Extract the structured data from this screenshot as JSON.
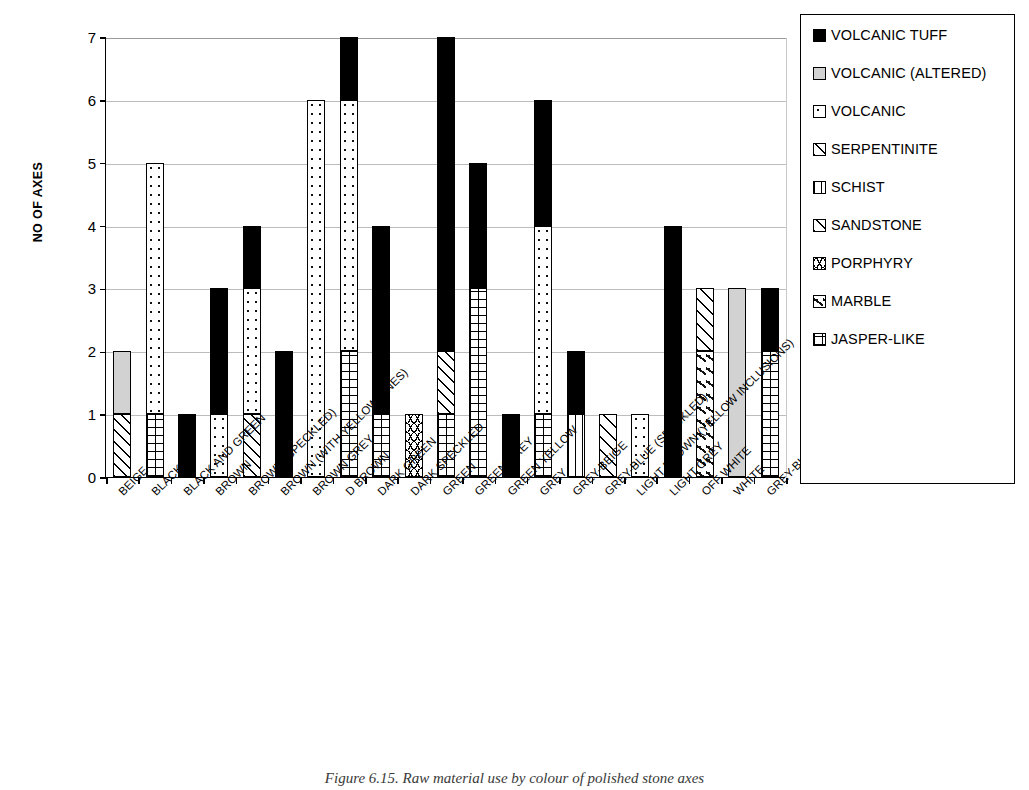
{
  "chart_data": {
    "type": "bar",
    "stacked": true,
    "title": "",
    "xlabel": "",
    "ylabel": "NO OF AXES",
    "ylim": [
      0,
      7
    ],
    "ytick_labels": [
      "0",
      "1",
      "2",
      "3",
      "4",
      "5",
      "6",
      "7"
    ],
    "grid": "horizontal",
    "legend_position": "right",
    "categories": [
      "BEIGE",
      "BLACK",
      "BLACK AND GREEN",
      "BROWN",
      "BROWN (SPECKLED)",
      "BROWN (WITH YELLOW LINES)",
      "BROWN GREY",
      "D BROWN",
      "DARK GREEN",
      "DARK SPECKLED",
      "GREEN",
      "GREEN GREY",
      "GREEN YELLOW",
      "GREY",
      "GREY-BEIGE",
      "GREY-BLUE (SPECKLED)",
      "LIGHT BROWN (YELLOW INCLUSIONS)",
      "LIGHT GREY",
      "OFF WHITE",
      "WHITE",
      "GREY-BLUE"
    ],
    "series": [
      {
        "name": "VOLCANIC TUFF",
        "key": "tuff",
        "pattern": "solid-black",
        "values": [
          0,
          0,
          1,
          2,
          1,
          2,
          0,
          1,
          3,
          0,
          5,
          2,
          1,
          2,
          1,
          0,
          0,
          4,
          0,
          0,
          1
        ]
      },
      {
        "name": "VOLCANIC (ALTERED)",
        "key": "volc_alt",
        "pattern": "grey-fill",
        "values": [
          1,
          0,
          0,
          0,
          0,
          0,
          0,
          0,
          0,
          0,
          0,
          0,
          0,
          0,
          0,
          0,
          0,
          0,
          0,
          3,
          0
        ]
      },
      {
        "name": "VOLCANIC",
        "key": "volc",
        "pattern": "fine-dots",
        "values": [
          0,
          4,
          0,
          1,
          2,
          0,
          6,
          4,
          0,
          0,
          0,
          0,
          0,
          3,
          0,
          0,
          1,
          0,
          0,
          0,
          0
        ]
      },
      {
        "name": "SERPENTINITE",
        "key": "serp",
        "pattern": "diagonal-hatch-right",
        "values": [
          1,
          0,
          0,
          0,
          1,
          0,
          0,
          0,
          0,
          0,
          1,
          0,
          0,
          0,
          0,
          0,
          0,
          0,
          0,
          0,
          0
        ]
      },
      {
        "name": "SCHIST",
        "key": "schist",
        "pattern": "vertical-lines",
        "values": [
          0,
          0,
          0,
          0,
          0,
          0,
          0,
          0,
          0,
          0,
          0,
          0,
          0,
          0,
          1,
          0,
          0,
          0,
          0,
          0,
          0
        ]
      },
      {
        "name": "SANDSTONE",
        "key": "sand",
        "pattern": "diagonal-hatch-wide",
        "values": [
          0,
          0,
          0,
          0,
          0,
          0,
          0,
          0,
          0,
          0,
          0,
          0,
          0,
          0,
          0,
          1,
          0,
          0,
          1,
          0,
          0
        ]
      },
      {
        "name": "PORPHYRY",
        "key": "porph",
        "pattern": "zigzag",
        "values": [
          0,
          0,
          0,
          0,
          0,
          0,
          0,
          0,
          0,
          1,
          0,
          0,
          0,
          0,
          0,
          0,
          0,
          0,
          0,
          0,
          0
        ]
      },
      {
        "name": "MARBLE",
        "key": "marble",
        "pattern": "dot-dash",
        "values": [
          0,
          0,
          0,
          0,
          0,
          0,
          0,
          0,
          0,
          0,
          0,
          0,
          0,
          0,
          0,
          0,
          0,
          0,
          2,
          0,
          0
        ]
      },
      {
        "name": "JASPER-LIKE",
        "key": "jasper",
        "pattern": "cross-grid",
        "values": [
          0,
          1,
          0,
          0,
          0,
          0,
          0,
          2,
          1,
          0,
          1,
          3,
          0,
          1,
          0,
          0,
          0,
          0,
          0,
          0,
          2
        ]
      }
    ],
    "totals": [
      2,
      5,
      1,
      3,
      4,
      2,
      6,
      7,
      4,
      1,
      7,
      5,
      1,
      6,
      2,
      1,
      1,
      4,
      3,
      3,
      3
    ],
    "stack_order_bottom_to_top": [
      "jasper",
      "porph",
      "marble",
      "schist",
      "sand",
      "serp",
      "volc",
      "volc_alt",
      "tuff"
    ]
  },
  "legend": {
    "items": [
      {
        "label": "VOLCANIC TUFF",
        "key": "tuff"
      },
      {
        "label": "VOLCANIC (ALTERED)",
        "key": "volc_alt"
      },
      {
        "label": "VOLCANIC",
        "key": "volc"
      },
      {
        "label": "SERPENTINITE",
        "key": "serp"
      },
      {
        "label": "SCHIST",
        "key": "schist"
      },
      {
        "label": "SANDSTONE",
        "key": "sand"
      },
      {
        "label": "PORPHYRY",
        "key": "porph"
      },
      {
        "label": "MARBLE",
        "key": "marble"
      },
      {
        "label": "JASPER-LIKE",
        "key": "jasper"
      }
    ]
  },
  "caption": "Figure 6.15. Raw material use by colour of polished stone axes"
}
